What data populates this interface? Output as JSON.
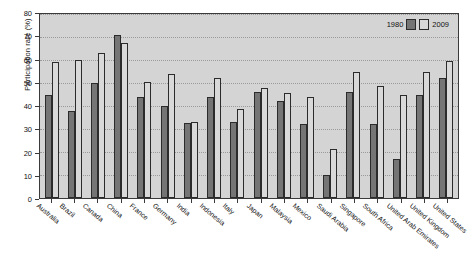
{
  "chart_data": {
    "type": "bar",
    "title": "",
    "xlabel": "",
    "ylabel": "Participation rate (%)",
    "ylim": [
      0,
      80
    ],
    "ytick_step": 10,
    "yticks": [
      0,
      10,
      20,
      30,
      40,
      50,
      60,
      70,
      80
    ],
    "grid": true,
    "legend_position": "top-right",
    "categories": [
      "Australia",
      "Brazil",
      "Canada",
      "China",
      "France",
      "Germany",
      "India",
      "Indonesia",
      "Italy",
      "Japan",
      "Malaysia",
      "Mexico",
      "Saudi Arabia",
      "Singapore",
      "South Africa",
      "United Arab Emirates",
      "United Kingdom",
      "United States"
    ],
    "series": [
      {
        "name": "1980",
        "color": "#757575",
        "values": [
          45,
          38,
          50,
          71,
          44,
          40,
          32.5,
          44,
          33,
          46,
          42,
          32,
          10,
          46,
          32,
          17,
          45,
          52
        ]
      },
      {
        "name": "2009",
        "color": "#d9d9d9",
        "values": [
          59,
          60,
          63,
          67.5,
          50.5,
          54,
          33,
          52,
          38.5,
          48,
          45.5,
          44,
          21.5,
          55,
          48.5,
          45,
          55,
          59.5
        ]
      }
    ]
  },
  "legend": {
    "left_label": "1980",
    "right_label": "2009"
  },
  "colors": {
    "series_1980": "#757575",
    "series_2009": "#d9d9d9",
    "plot_background": "#d4d4d4",
    "axis": "#3a3a3a",
    "gridline": "#9a9a9a"
  }
}
